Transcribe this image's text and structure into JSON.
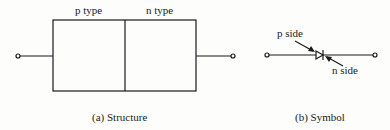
{
  "structure": {
    "p_label": "p type",
    "n_label": "n type",
    "caption": "(a) Structure"
  },
  "symbol": {
    "p_label": "p side",
    "n_label": "n side",
    "caption": "(b) Symbol"
  },
  "colors": {
    "stroke": "#1a1a1a",
    "background": "#fdfdfc"
  }
}
